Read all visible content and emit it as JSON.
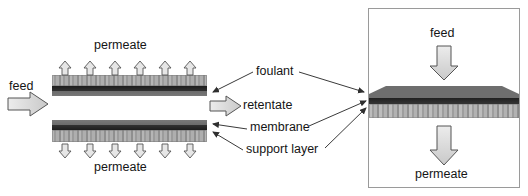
{
  "figure": {
    "type": "diagram",
    "background": "#ffffff"
  },
  "left_panel": {
    "name": "cross-flow-membrane-schematic",
    "labels": {
      "permeate_top": "permeate",
      "permeate_bottom": "permeate",
      "feed": "feed",
      "retentate": "retentate"
    },
    "arrows": {
      "feed_direction": "right",
      "retentate_direction": "right",
      "permeate_top_direction": "up",
      "permeate_bottom_direction": "down",
      "permeate_arrow_count": 6
    },
    "upper_block_layers": [
      "support layer",
      "membrane",
      "foulant"
    ],
    "lower_block_layers": [
      "foulant",
      "membrane",
      "support layer"
    ]
  },
  "callouts": {
    "foulant": "foulant",
    "membrane": "membrane",
    "support_layer": "support layer"
  },
  "right_panel": {
    "name": "dead-end-membrane-schematic",
    "labels": {
      "feed": "feed",
      "permeate": "permeate"
    },
    "arrows": {
      "feed_direction": "down",
      "permeate_direction": "down"
    },
    "layers": [
      "foulant",
      "membrane",
      "support layer"
    ],
    "border_color": "#9a9a9a"
  },
  "colors": {
    "foulant": "#6e6e6e",
    "membrane": "#2a2a2a",
    "support_layer": "#a8a8a8",
    "arrow_fill": "#d8d8d8",
    "arrow_stroke": "#4a4a4a",
    "leader_line": "#3a3a3a",
    "text": "#151515"
  }
}
